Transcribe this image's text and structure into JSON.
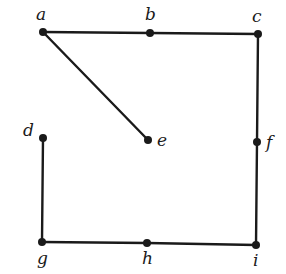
{
  "graph": {
    "nodes": [
      {
        "id": "a",
        "label": "a",
        "x": 43,
        "y": 32,
        "lx": 36,
        "ly": 20
      },
      {
        "id": "b",
        "label": "b",
        "x": 150,
        "y": 33,
        "lx": 145,
        "ly": 20
      },
      {
        "id": "c",
        "label": "c",
        "x": 258,
        "y": 34,
        "lx": 252,
        "ly": 22
      },
      {
        "id": "d",
        "label": "d",
        "x": 43,
        "y": 138,
        "lx": 23,
        "ly": 136
      },
      {
        "id": "e",
        "label": "e",
        "x": 148,
        "y": 140,
        "lx": 157,
        "ly": 146
      },
      {
        "id": "f",
        "label": "f",
        "x": 257,
        "y": 142,
        "lx": 266,
        "ly": 148
      },
      {
        "id": "g",
        "label": "g",
        "x": 42,
        "y": 242,
        "lx": 37,
        "ly": 264
      },
      {
        "id": "h",
        "label": "h",
        "x": 147,
        "y": 243,
        "lx": 142,
        "ly": 264
      },
      {
        "id": "i",
        "label": "i",
        "x": 256,
        "y": 245,
        "lx": 253,
        "ly": 266
      }
    ],
    "edges": [
      [
        "a",
        "b"
      ],
      [
        "b",
        "c"
      ],
      [
        "a",
        "e"
      ],
      [
        "c",
        "f"
      ],
      [
        "f",
        "i"
      ],
      [
        "d",
        "g"
      ],
      [
        "g",
        "h"
      ],
      [
        "h",
        "i"
      ]
    ]
  }
}
